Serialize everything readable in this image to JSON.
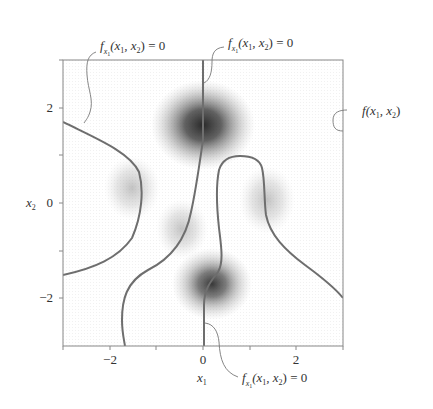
{
  "figure": {
    "xaxis": {
      "label": "x",
      "label_sub": "1",
      "range": [
        -3,
        3
      ],
      "ticks": [
        -3,
        -2,
        -1,
        0,
        1,
        2,
        3
      ],
      "tick_labels": [
        "−2",
        "0",
        "2"
      ]
    },
    "yaxis": {
      "label": "x",
      "label_sub": "2",
      "range": [
        -3,
        3
      ],
      "ticks": [
        -3,
        -2,
        -1,
        0,
        1,
        2,
        3
      ],
      "tick_labels": [
        "2",
        "0",
        "−2"
      ]
    },
    "annotations": [
      {
        "id": "top-left",
        "f": "f",
        "f_sub": "x",
        "f_subsub": "1",
        "args": "(x",
        "arg1_sub": "1",
        "mid": ", x",
        "arg2_sub": "2",
        "tail": ") = 0"
      },
      {
        "id": "top-center",
        "f": "f",
        "f_sub": "x",
        "f_subsub": "1",
        "args": "(x",
        "arg1_sub": "1",
        "mid": ", x",
        "arg2_sub": "2",
        "tail": ") = 0"
      },
      {
        "id": "bottom",
        "f": "f",
        "f_sub": "x",
        "f_subsub": "1",
        "args": "(x",
        "arg1_sub": "1",
        "mid": ", x",
        "arg2_sub": "2",
        "tail": ") = 0"
      },
      {
        "id": "right",
        "f": "f",
        "f_sub": "",
        "f_subsub": "",
        "args": "(x",
        "arg1_sub": "1",
        "mid": ", x",
        "arg2_sub": "2",
        "tail": ")"
      }
    ],
    "colors": {
      "frame": "#888888",
      "curve": "#6e6e6e",
      "density": "#2a2a2a",
      "leader": "#777777"
    },
    "density_peaks": [
      {
        "x": 0.0,
        "y": 1.65,
        "strength": 1.0,
        "sx": 0.85,
        "sy": 0.75
      },
      {
        "x": 0.2,
        "y": -1.7,
        "strength": 0.85,
        "sx": 0.65,
        "sy": 0.6
      },
      {
        "x": -1.5,
        "y": 0.3,
        "strength": 0.35,
        "sx": 0.5,
        "sy": 0.55
      },
      {
        "x": -0.45,
        "y": -0.55,
        "strength": 0.35,
        "sx": 0.45,
        "sy": 0.5
      },
      {
        "x": 1.4,
        "y": 0.05,
        "strength": 0.4,
        "sx": 0.5,
        "sy": 0.6
      }
    ]
  }
}
